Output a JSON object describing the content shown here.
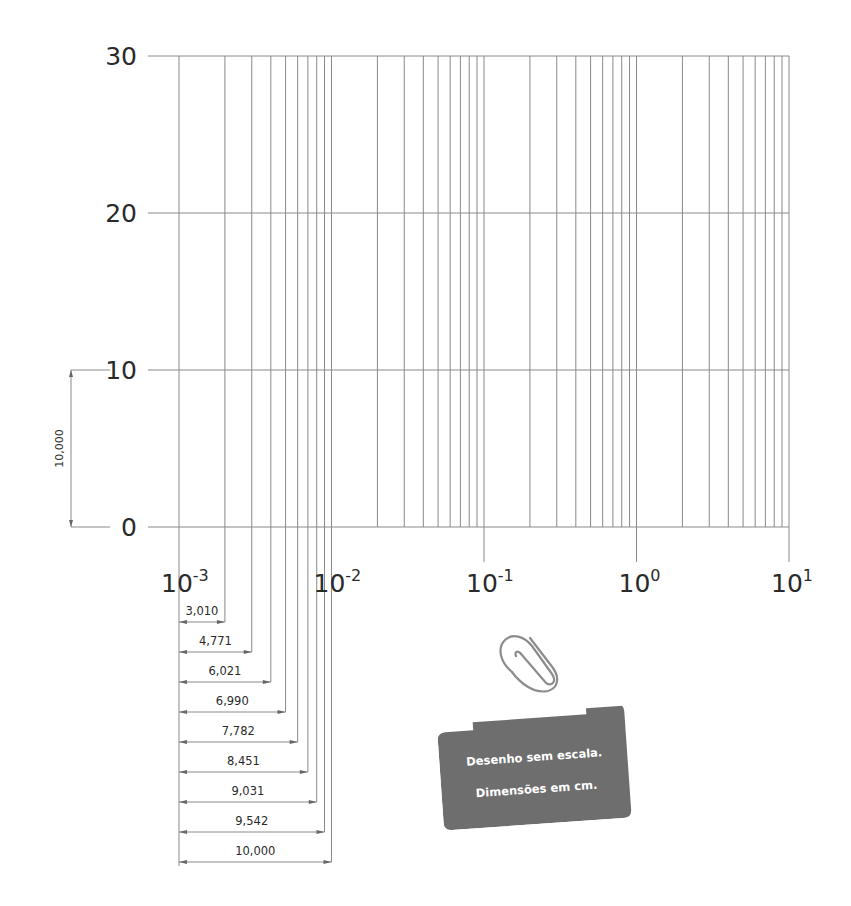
{
  "chart_data": {
    "type": "line",
    "title": "",
    "x_axis": {
      "scale": "log",
      "range": [
        0.001,
        10
      ],
      "tick_labels": [
        {
          "base": "10",
          "exp": "-3"
        },
        {
          "base": "10",
          "exp": "-2"
        },
        {
          "base": "10",
          "exp": "-1"
        },
        {
          "base": "10",
          "exp": "0"
        },
        {
          "base": "10",
          "exp": "1"
        }
      ],
      "minor_multiples": [
        2,
        3,
        4,
        5,
        6,
        7,
        8,
        9
      ]
    },
    "y_axis": {
      "scale": "linear",
      "range": [
        0,
        30
      ],
      "tick_labels": [
        "0",
        "10",
        "20",
        "30"
      ]
    },
    "grid": true,
    "vertical_dimension": {
      "label": "10,000",
      "from": 0,
      "to": 10
    },
    "horizontal_dimensions": [
      {
        "label": "3,010",
        "multiple": 2
      },
      {
        "label": "4,771",
        "multiple": 3
      },
      {
        "label": "6,021",
        "multiple": 4
      },
      {
        "label": "6,990",
        "multiple": 5
      },
      {
        "label": "7,782",
        "multiple": 6
      },
      {
        "label": "8,451",
        "multiple": 7
      },
      {
        "label": "9,031",
        "multiple": 8
      },
      {
        "label": "9,542",
        "multiple": 9
      },
      {
        "label": "10,000",
        "multiple": 10
      }
    ]
  },
  "note": {
    "line1": "Desenho sem escala.",
    "line2": "Dimensões em cm.",
    "color": "#6e6e6e"
  },
  "colors": {
    "grid": "#8a8a8a",
    "text": "#2a2a2a"
  }
}
